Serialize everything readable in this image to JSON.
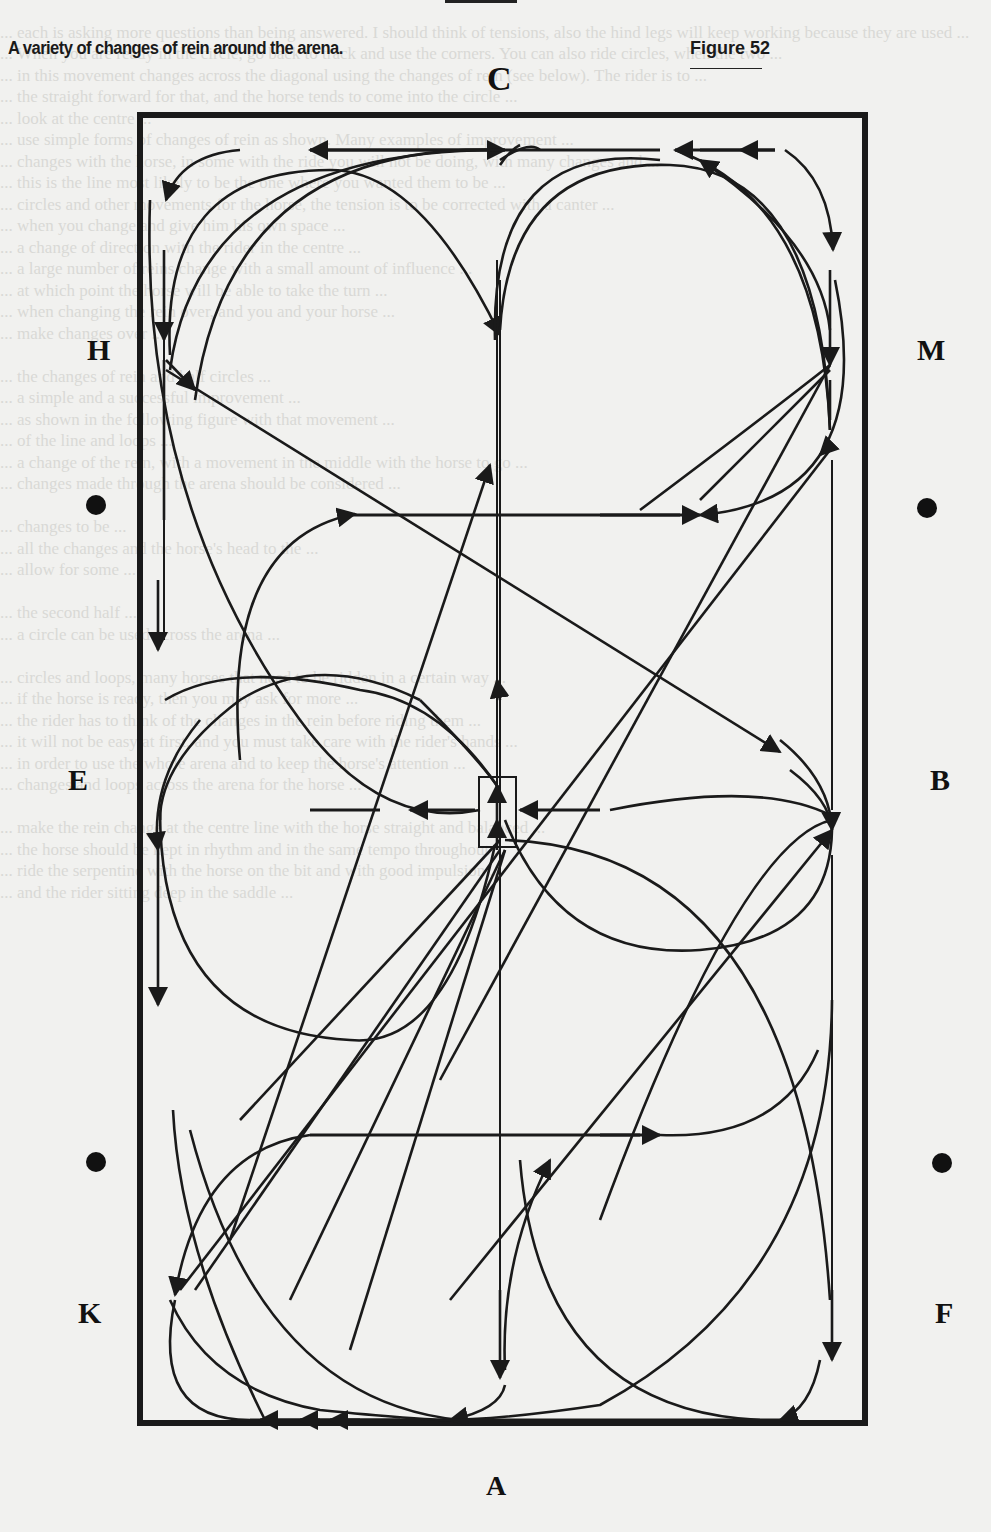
{
  "caption": "A variety of changes of rein around the arena.",
  "figure_label": "Figure 52",
  "markers": {
    "top": "C",
    "bottom": "A",
    "left_upper": "H",
    "left_middle": "E",
    "left_lower": "K",
    "right_upper": "M",
    "right_middle": "B",
    "right_lower": "F"
  },
  "diagram": {
    "type": "dressage-arena",
    "elements": [
      "arena outer rectangle",
      "centre line C-A with centre box X",
      "track lines along long sides",
      "diagonal changes of rein H-X-F and M-X-K",
      "half circles and loops with directional arrows",
      "E-B line through X",
      "quarter markers as dots"
    ],
    "line_color": "#1a1a1a",
    "background_color": "#f1f1ef"
  }
}
